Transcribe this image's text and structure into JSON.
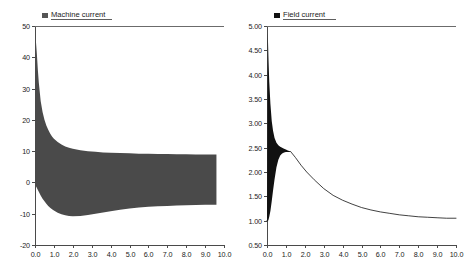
{
  "figure": {
    "background": "#ffffff",
    "width": 464,
    "height": 270,
    "panel_count": 2
  },
  "chart_data": [
    {
      "id": "machine-current",
      "type": "line",
      "title": "",
      "subtitle": "",
      "xlabel": "",
      "ylabel": "",
      "grid": false,
      "legend_position": "top-left",
      "legend": [
        "Machine current"
      ],
      "series_color": "#4a4a4a",
      "legend_marker_color": "#555555",
      "xlim": [
        0.0,
        10.0
      ],
      "ylim": [
        -20,
        50
      ],
      "xticks": [
        "0.0",
        "1.0",
        "2.0",
        "3.0",
        "4.0",
        "5.0",
        "6.0",
        "7.0",
        "8.0",
        "9.0",
        "10.0"
      ],
      "xtick_values": [
        0,
        1,
        2,
        3,
        4,
        5,
        6,
        7,
        8,
        9,
        10
      ],
      "yticks": [
        "50",
        "40",
        "30",
        "20",
        "10",
        "0",
        "-10",
        "-20"
      ],
      "ytick_values": [
        50,
        40,
        30,
        20,
        10,
        0,
        -10,
        -20
      ],
      "description": "Damped oscillating machine current; dense high-frequency oscillation shown as a filled envelope decaying from a peak of about 45 A to a steady band between roughly +9 and -7 A.",
      "envelope": {
        "x": [
          0.0,
          0.05,
          0.1,
          0.15,
          0.2,
          0.3,
          0.4,
          0.5,
          0.6,
          0.7,
          0.8,
          0.9,
          1.0,
          1.2,
          1.4,
          1.6,
          1.8,
          2.0,
          2.4,
          2.8,
          3.2,
          3.6,
          4.0,
          4.5,
          5.0,
          5.5,
          6.0,
          6.5,
          7.0,
          7.5,
          8.0,
          8.5,
          9.0,
          9.4,
          9.6
        ],
        "upper": [
          0.0,
          45.0,
          41.0,
          36.0,
          32.0,
          26.0,
          22.5,
          20.0,
          18.2,
          16.8,
          15.6,
          14.7,
          14.0,
          12.9,
          12.1,
          11.5,
          11.1,
          10.8,
          10.3,
          10.0,
          9.8,
          9.6,
          9.5,
          9.4,
          9.3,
          9.2,
          9.15,
          9.1,
          9.05,
          9.0,
          9.0,
          8.95,
          8.9,
          8.9,
          8.9
        ],
        "lower": [
          0.0,
          -1.2,
          -1.8,
          -2.4,
          -3.0,
          -4.2,
          -5.2,
          -6.0,
          -6.8,
          -7.5,
          -8.1,
          -8.6,
          -9.0,
          -9.7,
          -10.2,
          -10.5,
          -10.7,
          -10.8,
          -10.7,
          -10.4,
          -10.0,
          -9.6,
          -9.2,
          -8.7,
          -8.3,
          -8.0,
          -7.8,
          -7.6,
          -7.5,
          -7.4,
          -7.3,
          -7.2,
          -7.15,
          -7.1,
          -7.1
        ]
      }
    },
    {
      "id": "field-current",
      "type": "line",
      "title": "",
      "subtitle": "",
      "xlabel": "",
      "ylabel": "",
      "grid": false,
      "legend_position": "top-left",
      "legend": [
        "Field current"
      ],
      "series_color": "#111111",
      "legend_marker_color": "#111111",
      "xlim": [
        0.0,
        10.0
      ],
      "ylim": [
        0.5,
        5.0
      ],
      "xticks": [
        "0.0",
        "1.0",
        "2.0",
        "3.0",
        "4.0",
        "5.0",
        "6.0",
        "7.0",
        "8.0",
        "9.0",
        "10.0"
      ],
      "xtick_values": [
        0,
        1,
        2,
        3,
        4,
        5,
        6,
        7,
        8,
        9,
        10
      ],
      "yticks": [
        "5.00",
        "4.50",
        "4.00",
        "3.50",
        "3.00",
        "2.50",
        "2.00",
        "1.50",
        "1.00",
        "0.50"
      ],
      "ytick_values": [
        5.0,
        4.5,
        4.0,
        3.5,
        3.0,
        2.5,
        2.0,
        1.5,
        1.0,
        0.5
      ],
      "description": "Field current rises sharply from 1.0 to a peak near 4.85, oscillates heavily around 2.4-2.6 in a narrow dense band, then decays smoothly back toward a steady value of about 1.0.",
      "envelope": {
        "x": [
          0.0,
          0.04,
          0.08,
          0.12,
          0.18,
          0.25,
          0.32,
          0.4,
          0.5,
          0.6,
          0.7,
          0.8,
          0.9,
          1.0,
          1.1,
          1.25
        ],
        "upper": [
          1.0,
          4.85,
          4.3,
          3.85,
          3.4,
          3.05,
          2.85,
          2.7,
          2.6,
          2.55,
          2.52,
          2.5,
          2.48,
          2.46,
          2.44,
          2.42
        ],
        "lower": [
          1.0,
          1.0,
          1.02,
          1.08,
          1.2,
          1.4,
          1.62,
          1.85,
          2.1,
          2.25,
          2.34,
          2.38,
          2.4,
          2.41,
          2.41,
          2.41
        ]
      },
      "tail": {
        "x": [
          1.25,
          1.5,
          1.8,
          2.1,
          2.5,
          3.0,
          3.5,
          4.0,
          4.5,
          5.0,
          5.5,
          6.0,
          6.5,
          7.0,
          7.5,
          8.0,
          8.5,
          9.0,
          9.5,
          10.0
        ],
        "y": [
          2.42,
          2.3,
          2.14,
          2.0,
          1.84,
          1.66,
          1.52,
          1.42,
          1.34,
          1.27,
          1.22,
          1.18,
          1.15,
          1.12,
          1.1,
          1.08,
          1.07,
          1.06,
          1.05,
          1.05
        ]
      },
      "baseline": {
        "x": [
          0.0,
          0.04
        ],
        "y": [
          1.0,
          1.0
        ]
      }
    }
  ]
}
